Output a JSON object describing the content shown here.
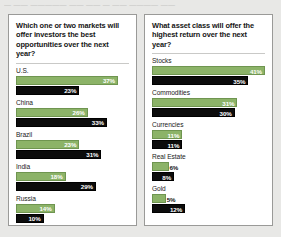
{
  "artifact_text": "— —— ————— ——  ——   — —— ———— ——",
  "colors": {
    "green": "#8cb368",
    "dark": "#0c0c0c",
    "background": "#e8e8e6",
    "panel": "#ffffff",
    "panel_border": "#9a9a98"
  },
  "chart_data": [
    {
      "type": "bar",
      "title": "Which one or two markets will offer investors the best opportunities over the next year?",
      "xlabel": "",
      "ylabel": "",
      "xlim": [
        0,
        41
      ],
      "grid": false,
      "orientation": "horizontal",
      "categories": [
        "U.S.",
        "China",
        "Brazil",
        "India",
        "Russia"
      ],
      "series": [
        {
          "name": "green",
          "values": [
            37,
            26,
            23,
            18,
            14
          ],
          "labels": [
            "37%",
            "26%",
            "23%",
            "18%",
            "14%"
          ]
        },
        {
          "name": "dark",
          "values": [
            23,
            33,
            31,
            29,
            10
          ],
          "labels": [
            "23%",
            "33%",
            "31%",
            "29%",
            "10%"
          ]
        }
      ]
    },
    {
      "type": "bar",
      "title": "What asset class will offer the highest return over the next year?",
      "xlabel": "",
      "ylabel": "",
      "xlim": [
        0,
        41
      ],
      "grid": false,
      "orientation": "horizontal",
      "categories": [
        "Stocks",
        "Commodities",
        "Currencies",
        "Real Estate",
        "Gold"
      ],
      "series": [
        {
          "name": "green",
          "values": [
            41,
            31,
            11,
            6,
            5
          ],
          "labels": [
            "41%",
            "31%",
            "11%",
            "6%",
            "5%"
          ]
        },
        {
          "name": "dark",
          "values": [
            35,
            30,
            11,
            8,
            12
          ],
          "labels": [
            "35%",
            "30%",
            "11%",
            "8%",
            "12%"
          ]
        }
      ]
    }
  ]
}
